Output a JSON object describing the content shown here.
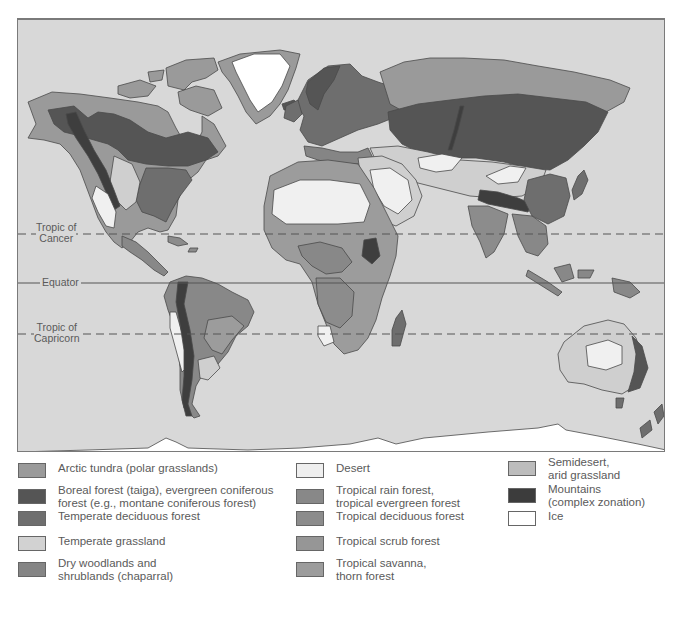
{
  "map": {
    "colors": {
      "ocean": "#d8d8d8",
      "arctic_tundra": "#9a9a9a",
      "boreal_forest": "#555555",
      "temperate_deciduous_forest": "#6e6e6e",
      "temperate_grassland": "#cfcfcf",
      "dry_woodlands": "#8a8a8a",
      "desert": "#f0f0f0",
      "tropical_rain_forest": "#888888",
      "tropical_deciduous_forest": "#8c8c8c",
      "tropical_scrub_forest": "#959595",
      "tropical_savanna": "#9c9c9c",
      "semidesert": "#b8b8b8",
      "mountains": "#3e3e3e",
      "ice": "#ffffff"
    },
    "latitude_lines": [
      {
        "name": "tropic-of-cancer",
        "line1": "Tropic of",
        "line2": "Cancer",
        "style": "dashed"
      },
      {
        "name": "equator",
        "line1": "Equator",
        "line2": "",
        "style": "solid"
      },
      {
        "name": "tropic-of-capricorn",
        "line1": "Tropic of",
        "line2": "Capricorn",
        "style": "dashed"
      }
    ]
  },
  "legend": {
    "items": [
      {
        "label": "Arctic tundra (polar grasslands)",
        "color": "#9a9a9a"
      },
      {
        "label": "Boreal forest (taiga), evergreen coniferous\nforest (e.g., montane coniferous forest)",
        "color": "#555555"
      },
      {
        "label": "Temperate deciduous forest",
        "color": "#6e6e6e"
      },
      {
        "label": "Temperate grassland",
        "color": "#d2d2d2"
      },
      {
        "label": "Dry woodlands and\nshrublands (chaparral)",
        "color": "#858585"
      },
      {
        "label": "Desert",
        "color": "#efefef"
      },
      {
        "label": "Tropical rain forest,\ntropical evergreen forest",
        "color": "#888888"
      },
      {
        "label": "Tropical deciduous forest",
        "color": "#8c8c8c"
      },
      {
        "label": "Tropical scrub forest",
        "color": "#969696"
      },
      {
        "label": "Tropical savanna,\nthorn forest",
        "color": "#9c9c9c"
      },
      {
        "label": "Semidesert,\narid grassland",
        "color": "#bcbcbc"
      },
      {
        "label": "Mountains\n(complex zonation)",
        "color": "#3c3c3c"
      },
      {
        "label": "Ice",
        "color": "#ffffff"
      }
    ]
  }
}
